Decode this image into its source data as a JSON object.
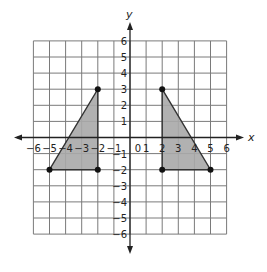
{
  "diagram": {
    "type": "coordinate-plane",
    "axes": {
      "x_label": "x",
      "y_label": "y",
      "xlim": [
        -6,
        6
      ],
      "ylim": [
        -6,
        6
      ]
    },
    "x_ticks": [
      "-6",
      "-5",
      "-4",
      "-3",
      "-2",
      "-1",
      "0",
      "1",
      "2",
      "3",
      "4",
      "5",
      "6"
    ],
    "y_ticks": [
      "6",
      "5",
      "4",
      "3",
      "2",
      "1",
      "-1",
      "-2",
      "-3",
      "-4",
      "-5",
      "-6"
    ],
    "origin_label": "0",
    "shapes": [
      {
        "name": "left-triangle",
        "vertices": [
          [
            -5,
            -2
          ],
          [
            -2,
            3
          ],
          [
            -2,
            -2
          ]
        ],
        "fill": "#a8a8a8"
      },
      {
        "name": "right-triangle",
        "vertices": [
          [
            2,
            3
          ],
          [
            5,
            -2
          ],
          [
            2,
            -2
          ]
        ],
        "fill": "#a8a8a8"
      }
    ],
    "points": [
      [
        -5,
        -2
      ],
      [
        -2,
        3
      ],
      [
        -2,
        -2
      ],
      [
        2,
        3
      ],
      [
        5,
        -2
      ],
      [
        2,
        -2
      ]
    ],
    "colors": {
      "grid": "#7a7a7a",
      "axis": "#222222",
      "point": "#111111"
    }
  }
}
